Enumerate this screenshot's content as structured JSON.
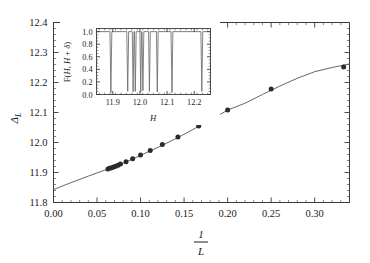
{
  "figure": {
    "caption_visible": false
  },
  "chart_data": [
    {
      "id": "main",
      "type": "scatter",
      "title": "",
      "xlabel": "1/L",
      "ylabel": "Δ_L",
      "xlim": [
        0.0,
        0.34
      ],
      "ylim": [
        11.8,
        12.4
      ],
      "grid": false,
      "legend": "none",
      "xticks": [
        0.0,
        0.05,
        0.1,
        0.15,
        0.2,
        0.25,
        0.3
      ],
      "xticklabels": [
        "0.00",
        "0.05",
        "0.10",
        "0.15",
        "0.20",
        "0.25",
        "0.30"
      ],
      "yticks": [
        11.8,
        11.9,
        12.0,
        12.1,
        12.2,
        12.3,
        12.4
      ],
      "yticklabels": [
        "11.8",
        "11.9",
        "12.0",
        "12.1",
        "12.2",
        "12.3",
        "12.4"
      ],
      "x": [
        0.0625,
        0.0645,
        0.0667,
        0.069,
        0.0714,
        0.0741,
        0.0769,
        0.0833,
        0.0909,
        0.1,
        0.1111,
        0.125,
        0.1429,
        0.1667,
        0.2,
        0.25,
        0.3333
      ],
      "y": [
        11.912,
        11.914,
        11.916,
        11.918,
        11.921,
        11.924,
        11.928,
        11.936,
        11.946,
        11.958,
        11.973,
        11.993,
        12.018,
        12.055,
        12.108,
        12.178,
        12.252
      ],
      "series": [
        {
          "name": "Δ_L data",
          "marker": "filled-circle",
          "color": "#2b2b2b"
        },
        {
          "name": "fit curve",
          "type": "line",
          "color": "#555555"
        }
      ],
      "fit_points_x": [
        0.0,
        0.02,
        0.04,
        0.06,
        0.08,
        0.1,
        0.12,
        0.14,
        0.16,
        0.18,
        0.2,
        0.22,
        0.24,
        0.26,
        0.28,
        0.3,
        0.32,
        0.34
      ],
      "fit_points_y": [
        11.843,
        11.866,
        11.888,
        11.909,
        11.931,
        11.957,
        11.984,
        12.012,
        12.043,
        12.075,
        12.108,
        12.131,
        12.16,
        12.188,
        12.214,
        12.236,
        12.25,
        12.262
      ]
    },
    {
      "id": "inset",
      "type": "line",
      "title": "",
      "xlabel": "H",
      "ylabel": "F(H, H + δ)",
      "xlim": [
        11.84,
        12.26
      ],
      "ylim": [
        0.0,
        1.05
      ],
      "grid": false,
      "legend": "none",
      "xticks": [
        11.9,
        12.0,
        12.1,
        12.2
      ],
      "xticklabels": [
        "11.9",
        "12.0",
        "12.1",
        "12.2"
      ],
      "yticks": [
        0.0,
        0.2,
        0.4,
        0.6,
        0.8,
        1.0
      ],
      "yticklabels": [
        "0.0",
        "0.2",
        "0.4",
        "0.6",
        "0.8",
        "1.0"
      ],
      "baseline": 1.0,
      "dip_positions": [
        11.893,
        11.955,
        11.975,
        11.983,
        12.003,
        12.011,
        12.035,
        12.064,
        12.118,
        12.228
      ],
      "dip_depths": [
        0.03,
        0.05,
        0.04,
        0.05,
        0.04,
        0.06,
        0.05,
        0.04,
        0.03,
        0.05
      ],
      "dip_widths": [
        0.0035,
        0.0035,
        0.0032,
        0.0032,
        0.0032,
        0.0034,
        0.0032,
        0.0032,
        0.0034,
        0.0034
      ]
    }
  ],
  "main_axis": {
    "ylabel_delta": "Δ",
    "ylabel_sub": "L",
    "xlabel_numerator": "1",
    "xlabel_denominator": "L"
  },
  "inset_axis": {
    "ylabel_prefix": "F(",
    "ylabel_h1": "H",
    "ylabel_comma": ", ",
    "ylabel_h2": "H",
    "ylabel_plus": " + ",
    "ylabel_delta": "δ",
    "ylabel_suffix": ")",
    "xlabel": "H"
  },
  "colors": {
    "marker": "#2b2b2b",
    "fit_line": "#555555",
    "axis": "#3a3a3a",
    "inset_curve": "#6b6b6b",
    "background": "#ffffff"
  }
}
